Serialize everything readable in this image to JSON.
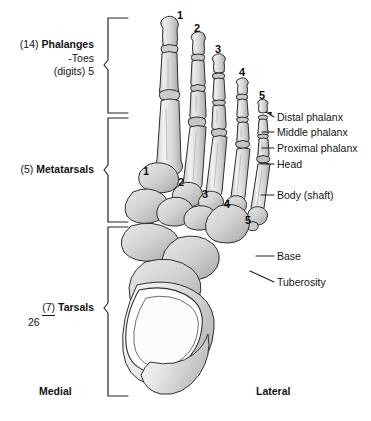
{
  "figure": {
    "background_color": "#ffffff",
    "bone_fill": "#d9d9d9",
    "bone_highlight": "#f2f2f2",
    "bone_outline": "#2b2b2b",
    "leader_color": "#1a1a1a"
  },
  "groups": [
    {
      "count_label": "(14)",
      "name": "Phalanges",
      "sub_line_1": "-Toes",
      "sub_line_2": "(digits) 5",
      "bracket_top": 18,
      "bracket_bottom": 113
    },
    {
      "count_label": "(5)",
      "name": "Metatarsals",
      "sub_line_1": "",
      "sub_line_2": "",
      "bracket_top": 118,
      "bracket_bottom": 222
    },
    {
      "count_label": "(7)",
      "name": "Tarsals",
      "total": "26",
      "bracket_top": 227,
      "bracket_bottom": 396
    }
  ],
  "toe_numbers": [
    "1",
    "2",
    "3",
    "4",
    "5"
  ],
  "metatarsal_numbers": [
    "1",
    "2",
    "3",
    "4",
    "5"
  ],
  "right_labels": [
    {
      "text": "Distal phalanx",
      "pointer": "arrow"
    },
    {
      "text": "Middle phalanx",
      "pointer": "line"
    },
    {
      "text": "Proximal phalanx",
      "pointer": "line"
    },
    {
      "text": "Head",
      "pointer": "line"
    },
    {
      "text": "Body (shaft)",
      "pointer": "line"
    },
    {
      "text": "Base",
      "pointer": "line"
    },
    {
      "text": "Tuberosity",
      "pointer": "diagonal"
    }
  ],
  "orientation": {
    "medial": "Medial",
    "lateral": "Lateral"
  }
}
